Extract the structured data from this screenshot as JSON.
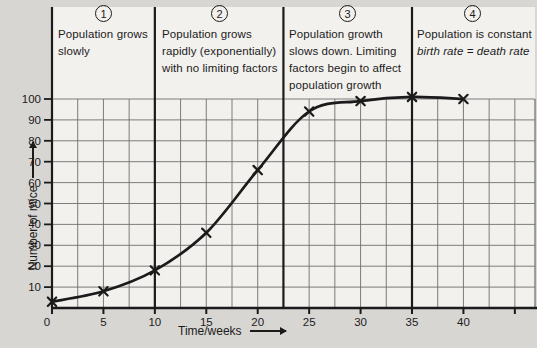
{
  "figure": {
    "background": "#d8d6d3",
    "panel_background": "#f3f1ee",
    "line_color": "#1b1b1b",
    "grid_color": "#6f6f6f"
  },
  "phases": [
    {
      "number": "1",
      "lines": [
        "Population grows",
        "slowly"
      ]
    },
    {
      "number": "2",
      "lines": [
        "Population grows",
        "rapidly (exponentially)",
        "with no limiting factors"
      ]
    },
    {
      "number": "3",
      "lines": [
        "Population growth",
        "slows down. Limiting",
        "factors begin to affect",
        "population growth"
      ]
    },
    {
      "number": "4",
      "lines": [
        "Population is constant"
      ],
      "italic_line": "birth rate = death rate"
    }
  ],
  "chart_data": {
    "type": "line",
    "title": "",
    "x": [
      0,
      5,
      10,
      15,
      20,
      25,
      30,
      35,
      40
    ],
    "values": [
      3,
      8,
      18,
      36,
      66,
      94,
      99,
      101,
      100
    ],
    "series_name": "Number of mice",
    "xlabel": "Time/weeks",
    "ylabel": "Number of mice",
    "x_tick_labels": [
      "0",
      "5",
      "10",
      "15",
      "20",
      "25",
      "30",
      "35",
      "40"
    ],
    "x_tick_values": [
      0,
      5,
      10,
      15,
      20,
      25,
      30,
      35,
      40
    ],
    "extra_unlabeled_x_tick": 45,
    "y_tick_labels": [
      "10",
      "20",
      "30",
      "40",
      "50",
      "60",
      "70",
      "80",
      "90",
      "100"
    ],
    "y_tick_values": [
      10,
      20,
      30,
      40,
      50,
      60,
      70,
      80,
      90,
      100
    ],
    "xlim": [
      0,
      47
    ],
    "ylim": [
      0,
      100
    ],
    "minor_x_step": 2.5,
    "major_y_step": 10,
    "grid": true,
    "marker": "x",
    "legend": "none",
    "phase_boundaries_weeks": [
      10,
      22.5,
      35
    ]
  }
}
